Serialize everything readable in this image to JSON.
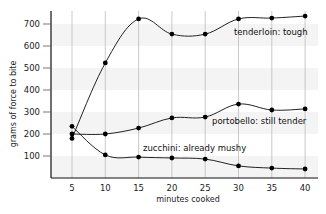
{
  "chart_data": {
    "type": "line",
    "title": "",
    "xlabel": "minutes cooked",
    "ylabel": "grams of force to bite",
    "x": [
      5,
      10,
      15,
      20,
      25,
      30,
      35,
      40
    ],
    "x_ticks": [
      "5",
      "10",
      "15",
      "20",
      "25",
      "30",
      "35",
      "40"
    ],
    "y_ticks": [
      "100",
      "200",
      "300",
      "400",
      "500",
      "600",
      "700"
    ],
    "ylim": [
      0,
      760
    ],
    "xlim": [
      0,
      42
    ],
    "grid": "vertical lines at x ticks, alternating light horizontal bands",
    "legend": "inline labels",
    "series": [
      {
        "name": "tenderloin: tough",
        "values": [
          180,
          523,
          723,
          654,
          654,
          723,
          727,
          736
        ]
      },
      {
        "name": "portobello: still tender",
        "values": [
          200,
          200,
          227,
          273,
          277,
          336,
          309,
          314
        ]
      },
      {
        "name": "zucchini: already mushy",
        "values": [
          235,
          105,
          95,
          91,
          86,
          55,
          45,
          41
        ]
      }
    ],
    "colors": {
      "line": "#222222",
      "marker": "#000000",
      "grid": "#bdbdbd",
      "band": "#f4f4f4",
      "axis": "#111111"
    }
  }
}
